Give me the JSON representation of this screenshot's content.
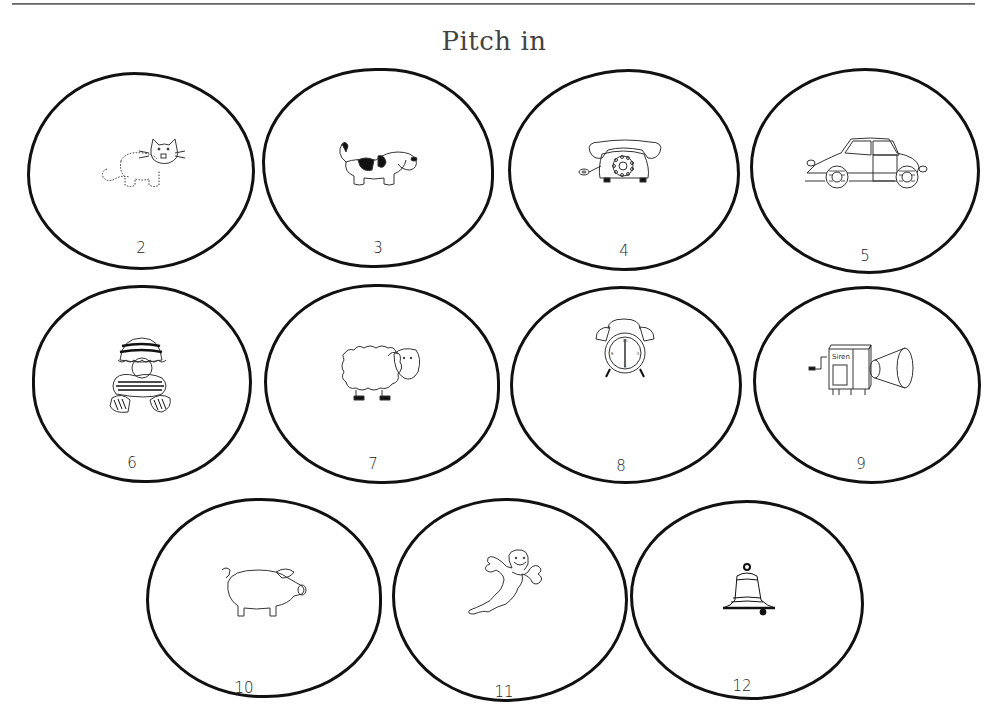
{
  "page": {
    "title": "Pitch in"
  },
  "cards": [
    {
      "number": "2",
      "picture": "cat"
    },
    {
      "number": "3",
      "picture": "dog"
    },
    {
      "number": "4",
      "picture": "telephone"
    },
    {
      "number": "5",
      "picture": "car"
    },
    {
      "number": "6",
      "picture": "child-in-striped-clothes"
    },
    {
      "number": "7",
      "picture": "sheep"
    },
    {
      "number": "8",
      "picture": "alarm-clock"
    },
    {
      "number": "9",
      "picture": "siren",
      "picture_label": "Siren"
    },
    {
      "number": "10",
      "picture": "pig"
    },
    {
      "number": "11",
      "picture": "ghost"
    },
    {
      "number": "12",
      "picture": "bell"
    }
  ]
}
